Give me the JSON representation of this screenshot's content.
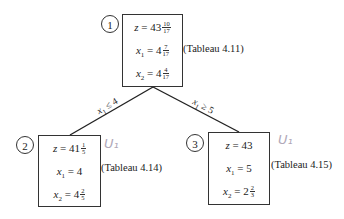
{
  "diagram": {
    "type": "branch-and-bound-tree",
    "nodes": [
      {
        "id": "1",
        "z": {
          "whole": "43",
          "num": "10",
          "den": "17"
        },
        "x1": {
          "whole": "4",
          "num": "7",
          "den": "17"
        },
        "x2": {
          "whole": "4",
          "num": "4",
          "den": "17"
        },
        "tableau": "(Tableau 4.11)",
        "annotation": ""
      },
      {
        "id": "2",
        "z": {
          "whole": "41",
          "num": "1",
          "den": "5"
        },
        "x1": {
          "whole": "4",
          "num": "",
          "den": ""
        },
        "x2": {
          "whole": "4",
          "num": "2",
          "den": "5"
        },
        "tableau": "(Tableau 4.14)",
        "annotation": "U₁"
      },
      {
        "id": "3",
        "z": {
          "whole": "43",
          "num": "",
          "den": ""
        },
        "x1": {
          "whole": "5",
          "num": "",
          "den": ""
        },
        "x2": {
          "whole": "2",
          "num": "2",
          "den": "3"
        },
        "tableau": "(Tableau 4.15)",
        "annotation": "U₁"
      }
    ],
    "edges": [
      {
        "from": "1",
        "to": "2",
        "label_var": "x",
        "label_sub": "1",
        "label_op": "≤ 4"
      },
      {
        "from": "1",
        "to": "3",
        "label_var": "x",
        "label_sub": "1",
        "label_op": "≥ 5"
      }
    ],
    "labels": {
      "z": "z",
      "x": "x",
      "eq": " = ",
      "sub1": "1",
      "sub2": "2"
    }
  }
}
